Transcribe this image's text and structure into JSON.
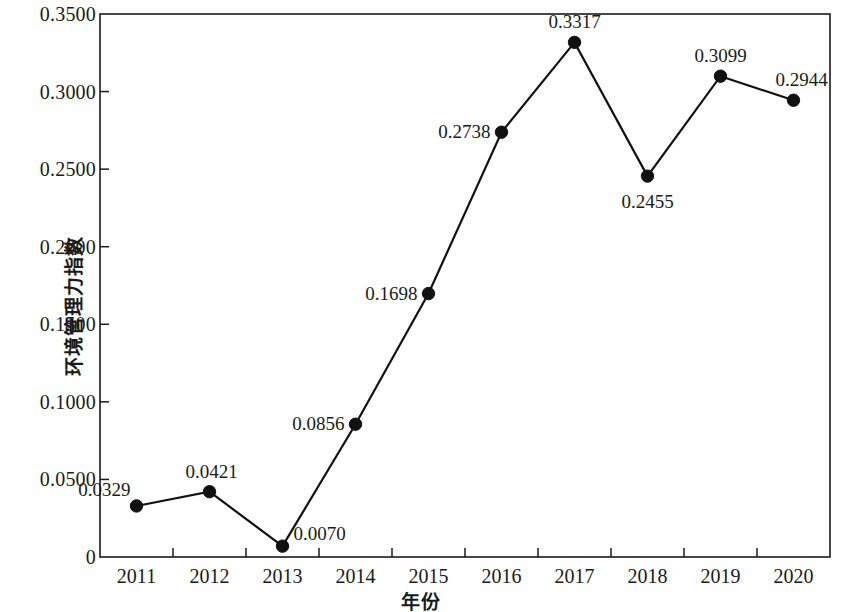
{
  "chart_data": {
    "type": "line",
    "title": "",
    "xlabel": "年份",
    "ylabel": "环境管理力指数",
    "categories": [
      "2011",
      "2012",
      "2013",
      "2014",
      "2015",
      "2016",
      "2017",
      "2018",
      "2019",
      "2020"
    ],
    "values": [
      0.0329,
      0.0421,
      0.007,
      0.0856,
      0.1698,
      0.2738,
      0.3317,
      0.2455,
      0.3099,
      0.2944
    ],
    "point_labels": [
      "0.0329",
      "0.0421",
      "0.0070",
      "0.0856",
      "0.1698",
      "0.2738",
      "0.3317",
      "0.2455",
      "0.3099",
      "0.2944"
    ],
    "ylim": [
      0,
      0.35
    ],
    "y_ticks": [
      0,
      0.05,
      0.1,
      0.15,
      0.2,
      0.25,
      0.3,
      0.35
    ],
    "y_tick_labels": [
      "0",
      "0.0500",
      "0.1000",
      "0.1500",
      "0.2000",
      "0.2500",
      "0.3000",
      "0.3500"
    ],
    "grid": false,
    "legend": "none",
    "series_color": "#111111",
    "marker": "circle",
    "marker_color": "#111111",
    "frame": true,
    "tick_direction": "in"
  },
  "axes": {
    "y_labels": [
      {
        "text": "0.3500",
        "value": 0.35
      },
      {
        "text": "0.3000",
        "value": 0.3
      },
      {
        "text": "0.2500",
        "value": 0.25
      },
      {
        "text": "0.2000",
        "value": 0.2
      },
      {
        "text": "0.1500",
        "value": 0.15
      },
      {
        "text": "0.1000",
        "value": 0.1
      },
      {
        "text": "0.0500",
        "value": 0.05
      },
      {
        "text": "0",
        "value": 0
      }
    ],
    "x_labels": [
      "2011",
      "2012",
      "2013",
      "2014",
      "2015",
      "2016",
      "2017",
      "2018",
      "2019",
      "2020"
    ],
    "y_title": "环境管理力指数",
    "x_title": "年份"
  },
  "point_annotations": [
    {
      "label": "0.0329",
      "year": "2011",
      "value": 0.0329
    },
    {
      "label": "0.0421",
      "year": "2012",
      "value": 0.0421
    },
    {
      "label": "0.0070",
      "year": "2013",
      "value": 0.007
    },
    {
      "label": "0.0856",
      "year": "2014",
      "value": 0.0856
    },
    {
      "label": "0.1698",
      "year": "2015",
      "value": 0.1698
    },
    {
      "label": "0.2738",
      "year": "2016",
      "value": 0.2738
    },
    {
      "label": "0.3317",
      "year": "2017",
      "value": 0.3317
    },
    {
      "label": "0.2455",
      "year": "2018",
      "value": 0.2455
    },
    {
      "label": "0.3099",
      "year": "2019",
      "value": 0.3099
    },
    {
      "label": "0.2944",
      "year": "2020",
      "value": 0.2944
    }
  ]
}
